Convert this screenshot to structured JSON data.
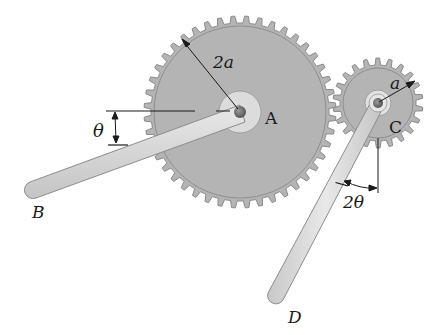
{
  "figure": {
    "colors": {
      "background": "#ffffff",
      "gear_fill": "#b4b4b4",
      "gear_edge": "#8a8a8a",
      "hub_fill": "#dcdcdc",
      "arm_fill": "#d6d6d6",
      "arm_edge": "#8c8c8c",
      "line": "#1a1a1a"
    },
    "gear_A": {
      "label": "A",
      "radius_label": "2a",
      "center": [
        240,
        112
      ],
      "root_radius": 89,
      "tip_radius": 96,
      "teeth": 44
    },
    "gear_C": {
      "label": "C",
      "radius_label": "a",
      "center": [
        378,
        103
      ],
      "root_radius": 38,
      "tip_radius": 45,
      "teeth": 22
    },
    "arm_B": {
      "label": "B",
      "angle_label": "θ"
    },
    "arm_D": {
      "label": "D",
      "angle_label": "2θ"
    }
  }
}
